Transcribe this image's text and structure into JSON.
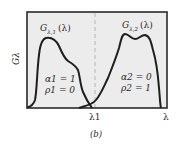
{
  "figure": {
    "caption": "(b)",
    "y_axis_label": "Gλ",
    "x_tick_label": "λ1",
    "x_axis_end_label": "λ",
    "colors": {
      "frame": "#2a2a2a",
      "plot_background": "#ececec",
      "curve": "#1e1e1e",
      "dashed_line": "#b0b0b0",
      "text": "#2a2a2a"
    },
    "curves": [
      {
        "name": "G_{λ,1}(λ)",
        "label_main": "G",
        "label_sub": "λ,1",
        "label_arg": "(λ)",
        "props": [
          "α1 = 1",
          "ρ1 = 0"
        ]
      },
      {
        "name": "G_{λ,2}(λ)",
        "label_main": "G",
        "label_sub": "λ,2",
        "label_arg": "(λ)",
        "props": [
          "α2 = 0",
          "ρ2 = 1"
        ]
      }
    ],
    "divider": {
      "at": "λ1",
      "style": "dashed"
    }
  }
}
